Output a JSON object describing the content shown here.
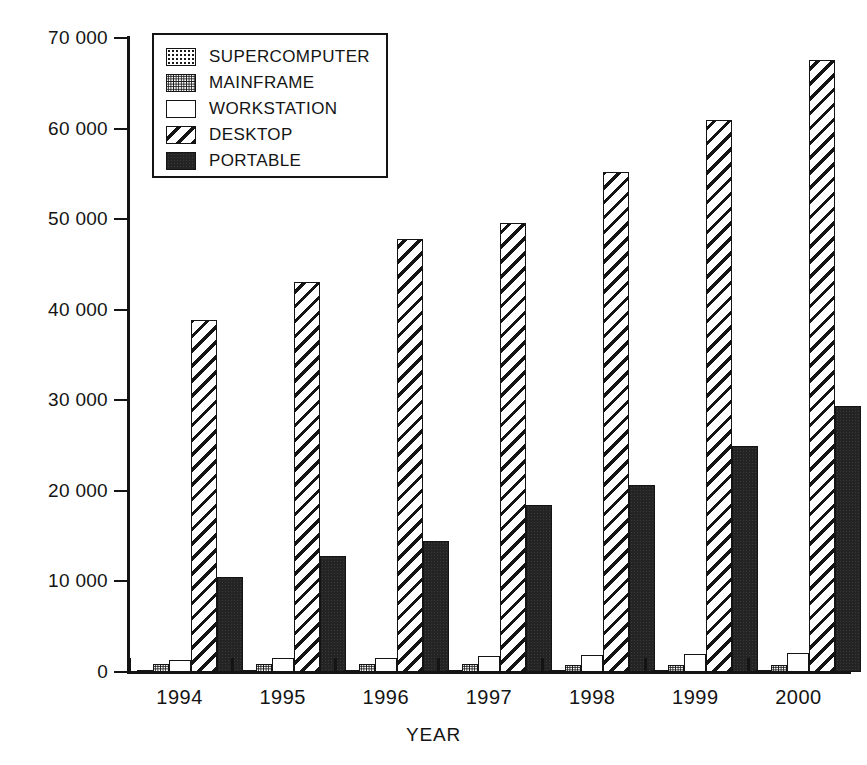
{
  "chart_data": {
    "type": "bar",
    "title": "",
    "subtitle": "",
    "xlabel": "YEAR",
    "ylabel": "K UNITS",
    "categories": [
      "1994",
      "1995",
      "1996",
      "1997",
      "1998",
      "1999",
      "2000"
    ],
    "ylim": [
      0,
      70000
    ],
    "yticks": [
      0,
      10000,
      20000,
      30000,
      40000,
      50000,
      60000,
      70000
    ],
    "ytick_labels": [
      "0",
      "10 000",
      "20 000",
      "30 000",
      "40 000",
      "50 000",
      "60 000",
      "70 000"
    ],
    "grid": false,
    "legend_position": "upper-left-inside",
    "series": [
      {
        "name": "SUPERCOMPUTER",
        "fill": "dotted-sparse",
        "values": [
          120,
          130,
          140,
          150,
          160,
          170,
          180
        ]
      },
      {
        "name": "MAINFRAME",
        "fill": "dotted-dense",
        "values": [
          900,
          900,
          850,
          850,
          800,
          800,
          800
        ]
      },
      {
        "name": "WORKSTATION",
        "fill": "white",
        "values": [
          1300,
          1500,
          1600,
          1800,
          1900,
          2000,
          2100
        ]
      },
      {
        "name": "DESKTOP",
        "fill": "diagonal-hatch",
        "values": [
          38900,
          43100,
          47800,
          49600,
          55200,
          60900,
          67600
        ]
      },
      {
        "name": "PORTABLE",
        "fill": "solid-black",
        "values": [
          10500,
          12800,
          14500,
          18400,
          20700,
          25000,
          29400
        ]
      }
    ]
  },
  "legend": {
    "items": [
      {
        "label": "SUPERCOMPUTER",
        "swatch": "dotted-sparse"
      },
      {
        "label": "MAINFRAME",
        "swatch": "dotted-dense"
      },
      {
        "label": "WORKSTATION",
        "swatch": "white"
      },
      {
        "label": "DESKTOP",
        "swatch": "diagonal-hatch"
      },
      {
        "label": "PORTABLE",
        "swatch": "solid-black"
      }
    ]
  },
  "colors": {
    "ink": "#141414",
    "background": "#ffffff",
    "portable_fill": "#242424"
  }
}
